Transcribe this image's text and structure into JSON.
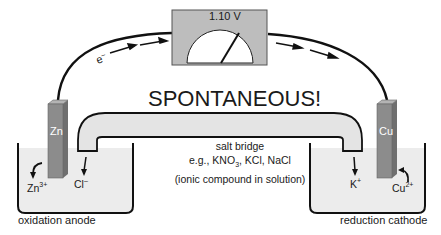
{
  "title": "SPONTANEOUS!",
  "voltmeter": {
    "reading": "1.10 V"
  },
  "electron_label": {
    "base": "e",
    "sup": "–"
  },
  "anode": {
    "electrode_label": "Zn",
    "ion": {
      "base": "Zn",
      "sup": "3+"
    },
    "bridge_ion": {
      "base": "Cl",
      "sup": "–"
    },
    "caption": "oxidation anode"
  },
  "cathode": {
    "electrode_label": "Cu",
    "ion": {
      "base": "Cu",
      "sup": "2+"
    },
    "bridge_ion": {
      "base": "K",
      "sup": "+"
    },
    "caption": "reduction cathode"
  },
  "salt_bridge": {
    "line1": "salt bridge",
    "line2_pre": "e.g., KNO",
    "line2_sub": "3",
    "line2_post": ", KCl, NaCl",
    "line3": "(ionic compound in solution)"
  },
  "colors": {
    "electrode": "#8c8c8c",
    "electrode_side": "#b4b4b4",
    "solution": "#ececec",
    "bridge": "#e4e4e4",
    "meter_body": "#bdbdbd",
    "wire": "#111111"
  }
}
